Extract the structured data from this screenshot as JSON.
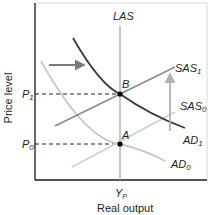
{
  "diagram": {
    "type": "AD-AS model",
    "axes": {
      "ylabel": "Price level",
      "xlabel": "Real output",
      "x_tick": "Y",
      "x_tick_sub": "P",
      "y_ticks": [
        {
          "label": "P",
          "sub": "1"
        },
        {
          "label": "P",
          "sub": "0"
        }
      ]
    },
    "curves": {
      "las": {
        "label": "LAS",
        "color": "#b5b5b5"
      },
      "sas1": {
        "label": "SAS",
        "sub": "1",
        "color": "#8c8c8c"
      },
      "sas0": {
        "label": "SAS",
        "sub": "0",
        "color": "#cfcfcf"
      },
      "ad1": {
        "label": "AD",
        "sub": "1",
        "color": "#3a3a3a"
      },
      "ad0": {
        "label": "AD",
        "sub": "0",
        "color": "#c8c8c8"
      }
    },
    "points": {
      "a": {
        "label": "A"
      },
      "b": {
        "label": "B"
      }
    },
    "arrows": {
      "demand_shift": {
        "direction": "right",
        "color": "#7a7a7a"
      },
      "supply_shift": {
        "direction": "up",
        "color": "#b0b0b0"
      }
    }
  }
}
